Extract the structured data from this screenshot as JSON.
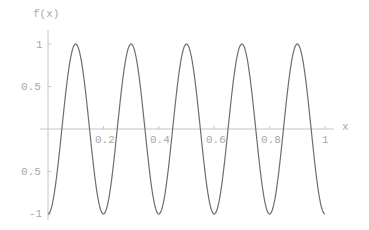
{
  "chart_data": {
    "type": "line",
    "title": "",
    "xlabel": "x",
    "ylabel": "f(x)",
    "xlim": [
      0,
      1
    ],
    "ylim": [
      -1,
      1
    ],
    "grid": false,
    "legend": null,
    "x_ticks": [
      0.2,
      0.4,
      0.6,
      0.8,
      1
    ],
    "x_tick_labels": [
      "0.2",
      "0.4",
      "0.6",
      "0.8",
      "1"
    ],
    "y_ticks": [
      1,
      0.5,
      -0.5,
      -1
    ],
    "y_tick_labels": [
      "1",
      "0.5",
      "0.5",
      "-1"
    ],
    "series": [
      {
        "name": "f(x)",
        "function": "-cos(10*pi*x)",
        "x": [
          0,
          0.05,
          0.1,
          0.15,
          0.2,
          0.25,
          0.3,
          0.35,
          0.4,
          0.45,
          0.5,
          0.55,
          0.6,
          0.65,
          0.7,
          0.75,
          0.8,
          0.85,
          0.9,
          0.95,
          1.0
        ],
        "values": [
          -1,
          0,
          1,
          0,
          -1,
          0,
          1,
          0,
          -1,
          0,
          1,
          0,
          -1,
          0,
          1,
          0,
          -1,
          0,
          1,
          0,
          -1
        ]
      }
    ],
    "colors": {
      "curve": "#6e6e6e",
      "axis": "#c4c4c4",
      "label": "#a8a8a8"
    }
  }
}
